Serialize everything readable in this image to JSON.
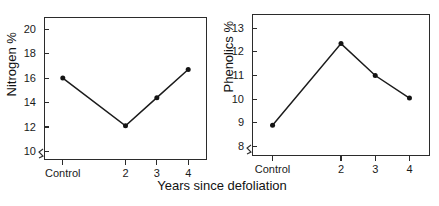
{
  "figure": {
    "shared_xlabel": "Years since defoliation",
    "panels": [
      "nitrogen",
      "phenolics"
    ]
  },
  "chart_data": [
    {
      "type": "line",
      "name": "nitrogen",
      "title": "",
      "xlabel": "Years since defoliation",
      "ylabel": "Nitrogen %",
      "categories": [
        "Control",
        "2",
        "3",
        "4"
      ],
      "x": [
        0,
        2,
        3,
        4
      ],
      "values": [
        16.0,
        12.1,
        14.4,
        16.7
      ],
      "series": [
        {
          "name": "Nitrogen %",
          "values": [
            16.0,
            12.1,
            14.4,
            16.7
          ]
        }
      ],
      "xtick_labels": [
        "Control",
        "2",
        "3",
        "4"
      ],
      "ytick_labels": [
        "10",
        "12",
        "14",
        "16",
        "18",
        "20"
      ],
      "yticks": [
        10,
        12,
        14,
        16,
        18,
        20
      ],
      "ylim": [
        9.3,
        21.0
      ],
      "xlim": [
        -0.6,
        4.6
      ],
      "axis_break": true,
      "grid": false,
      "legend": "none",
      "marker": "filled-circle"
    },
    {
      "type": "line",
      "name": "phenolics",
      "title": "",
      "xlabel": "Years since defoliation",
      "ylabel": "Phenolics %",
      "categories": [
        "Control",
        "2",
        "3",
        "4"
      ],
      "x": [
        0,
        2,
        3,
        4
      ],
      "values": [
        8.9,
        12.35,
        11.0,
        10.05
      ],
      "series": [
        {
          "name": "Phenolics %",
          "values": [
            8.9,
            12.35,
            11.0,
            10.05
          ]
        }
      ],
      "xtick_labels": [
        "Control",
        "2",
        "3",
        "4"
      ],
      "ytick_labels": [
        "8",
        "9",
        "10",
        "11",
        "12",
        "13"
      ],
      "yticks": [
        8,
        9,
        10,
        11,
        12,
        13
      ],
      "ylim": [
        7.6,
        13.6
      ],
      "xlim": [
        -0.6,
        4.6
      ],
      "axis_break": true,
      "grid": false,
      "legend": "none",
      "marker": "filled-circle"
    }
  ],
  "style": {
    "line_color": "#1b1b1b",
    "marker_color": "#141414",
    "axis_color": "#2b2b2b",
    "text_color": "#1a1a1a",
    "background": "#ffffff"
  }
}
